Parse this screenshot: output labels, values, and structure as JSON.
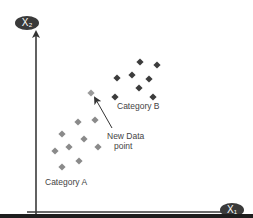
{
  "diagram": {
    "y_axis_label": "X₂",
    "x_axis_label": "X₁",
    "category_a_label": "Category A",
    "category_b_label": "Category B",
    "new_point_label_line1": "New Data",
    "new_point_label_line2": "point",
    "colors": {
      "category_a": "#8a8a8a",
      "category_b": "#3c3c3c",
      "new_point": "#9a9a9a",
      "axis": "#3a3a3a"
    }
  },
  "chart_data": {
    "type": "scatter",
    "title": "",
    "xlabel": "X1",
    "ylabel": "X2",
    "series": [
      {
        "name": "Category A",
        "points": [
          [
            78,
            122
          ],
          [
            95,
            120
          ],
          [
            62,
            134
          ],
          [
            84,
            139
          ],
          [
            69,
            147
          ],
          [
            55,
            151
          ],
          [
            98,
            147
          ],
          [
            79,
            161
          ],
          [
            62,
            167
          ]
        ]
      },
      {
        "name": "Category B",
        "points": [
          [
            140,
            62
          ],
          [
            157,
            65
          ],
          [
            132,
            75
          ],
          [
            117,
            78
          ],
          [
            149,
            79
          ],
          [
            139,
            88
          ],
          [
            115,
            97
          ],
          [
            153,
            97
          ]
        ]
      },
      {
        "name": "New Data point",
        "points": [
          [
            91,
            93
          ]
        ]
      }
    ],
    "annotations": [
      "New Data point (arrow pointing to new point)"
    ],
    "grid": false,
    "legend": "none"
  }
}
